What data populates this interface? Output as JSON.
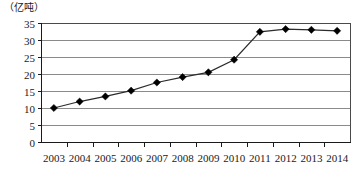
{
  "chart_data": {
    "type": "line",
    "title": "",
    "subtitle": "",
    "xlabel": "",
    "ylabel": "（亿吨）",
    "unit_label": "（亿吨）",
    "categories": [
      "2003",
      "2004",
      "2005",
      "2006",
      "2007",
      "2008",
      "2009",
      "2010",
      "2011",
      "2012",
      "2013",
      "2014"
    ],
    "values": [
      10.0,
      11.9,
      13.4,
      15.1,
      17.5,
      19.1,
      20.5,
      24.2,
      32.4,
      33.2,
      33.0,
      32.7
    ],
    "series": [
      {
        "name": "",
        "values": [
          10.0,
          11.9,
          13.4,
          15.1,
          17.5,
          19.1,
          20.5,
          24.2,
          32.4,
          33.2,
          33.0,
          32.7
        ]
      }
    ],
    "ylim": [
      0,
      35
    ],
    "yticks": [
      0,
      5,
      10,
      15,
      20,
      25,
      30,
      35
    ],
    "ytick_labels": [
      "0",
      "5",
      "10",
      "15",
      "20",
      "25",
      "30",
      "35"
    ],
    "xtick_labels": [
      "2003",
      "2004",
      "2005",
      "2006",
      "2007",
      "2008",
      "2009",
      "2010",
      "2011",
      "2012",
      "2013",
      "2014"
    ],
    "grid": true,
    "grid_axis": "y",
    "legend": false,
    "legend_position": "none",
    "marker": "diamond",
    "line_color": "#2b2b2b",
    "marker_color": "#000000",
    "grid_color": "#8a8a8a",
    "annotations": []
  }
}
